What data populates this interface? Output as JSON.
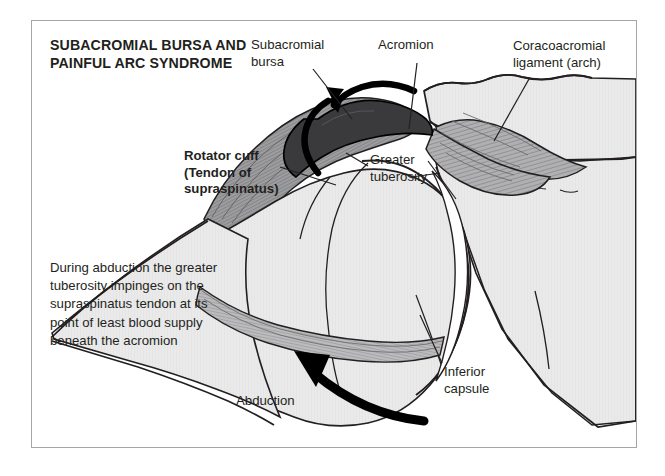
{
  "figure": {
    "title": "SUBACROMIAL BURSA AND PAINFUL ARC SYNDROME",
    "description": "During abduction the greater tuberosity impinges on the supraspinatus tendon at its point of least blood supply beneath the acromion",
    "labels": {
      "subacromial_bursa": "Subacromial\nbursa",
      "acromion": "Acromion",
      "coracoacromial_ligament": "Coracoacromial\nligament (arch)",
      "rotator_cuff": "Rotator cuff\n(Tendon of\nsupraspinatus)",
      "greater_tuberosity": "Greater\ntuberosity",
      "inferior_capsule": "Inferior\ncapsule",
      "abduction": "Abduction"
    },
    "colors": {
      "ink": "#231f20",
      "bone_fill": "#e9e9e9",
      "bone_fill_alt": "#e2e2e2",
      "bursa_fill": "#3a3a3c",
      "tendon_fill": "#9a9a9c",
      "ligament_fill": "#a9a9ab",
      "capsule_fill": "#b4b4b6",
      "joint_space": "#ffffff",
      "frame_border": "#a6a6a6",
      "page_background": "#ffffff"
    },
    "icons": {
      "motion_arrow_left": "curved-arrow-icon",
      "motion_arrow_top": "curved-arrow-icon",
      "abduction_arrow": "thick-curved-arrow-icon"
    }
  }
}
